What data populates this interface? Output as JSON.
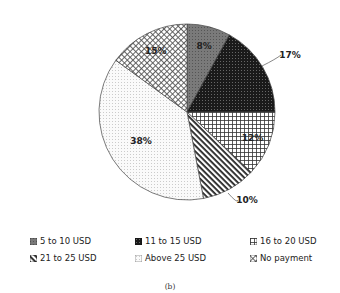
{
  "chart_data": {
    "type": "pie",
    "title": "",
    "caption": "(b)",
    "start_angle_deg": 0,
    "direction": "clockwise",
    "categories": [
      "5 to 10 USD",
      "11 to 15 USD",
      "16 to 20 USD",
      "21 to 25 USD",
      "Above 25 USD",
      "No payment"
    ],
    "values": [
      8,
      17,
      12,
      10,
      38,
      15
    ],
    "labels": [
      "8%",
      "17%",
      "12%",
      "10%",
      "38%",
      "15%"
    ],
    "patterns": [
      "dense-gray",
      "dark-dotted",
      "grid",
      "diagonal-stripes",
      "light-dots",
      "crosshatch"
    ],
    "legend_position": "bottom",
    "legend_columns": 3
  },
  "legend": {
    "items": [
      {
        "label": "5 to 10 USD"
      },
      {
        "label": "11 to 15 USD"
      },
      {
        "label": "16 to 20 USD"
      },
      {
        "label": "21 to 25 USD"
      },
      {
        "label": "Above 25 USD"
      },
      {
        "label": "No payment"
      }
    ]
  },
  "caption": "(b)"
}
